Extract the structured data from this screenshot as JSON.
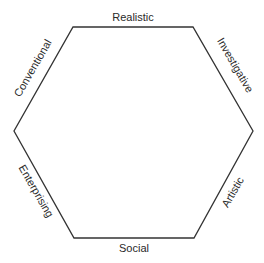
{
  "diagram": {
    "type": "hexagon",
    "title": "",
    "line_color": "#333333",
    "text_color": "#2a2a2a",
    "sides": [
      {
        "id": "top",
        "label": "Realistic"
      },
      {
        "id": "upper-right",
        "label": "Investigative"
      },
      {
        "id": "lower-right",
        "label": "Artistic"
      },
      {
        "id": "bottom",
        "label": "Social"
      },
      {
        "id": "lower-left",
        "label": "Enterprising"
      },
      {
        "id": "upper-left",
        "label": "Conventional"
      }
    ]
  }
}
